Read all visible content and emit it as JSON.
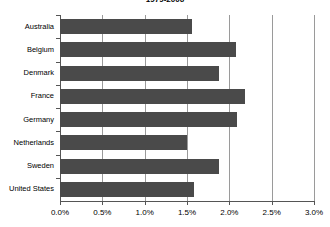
{
  "chart_data": {
    "type": "bar",
    "orientation": "horizontal",
    "title": "1979-2006",
    "xlabel": "",
    "ylabel": "",
    "categories": [
      "Australia",
      "Belgium",
      "Denmark",
      "France",
      "Germany",
      "Netherlands",
      "Sweden",
      "United States"
    ],
    "values": [
      1.56,
      2.08,
      1.88,
      2.18,
      2.09,
      1.5,
      1.88,
      1.58
    ],
    "value_format": "percent",
    "xlim": [
      0.0,
      3.0
    ],
    "xticks": [
      0.0,
      0.5,
      1.0,
      1.5,
      2.0,
      2.5,
      3.0
    ],
    "xtick_labels": [
      "0.0%",
      "0.5%",
      "1.0%",
      "1.5%",
      "2.0%",
      "2.5%",
      "3.0%"
    ],
    "grid": true,
    "grid_axis": "x",
    "legend": false,
    "series": [
      {
        "name": "",
        "values": [
          1.56,
          2.08,
          1.88,
          2.18,
          2.09,
          1.5,
          1.88,
          1.58
        ]
      }
    ],
    "colors": {
      "bar": "#4a4a4a",
      "gridline": "#9a9a9a",
      "axis": "#555555",
      "background": "#ffffff",
      "text": "#000000"
    }
  }
}
